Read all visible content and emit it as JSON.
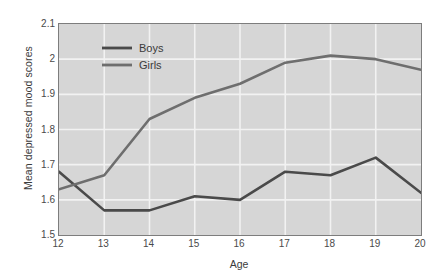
{
  "chart_data": {
    "type": "line",
    "title": "",
    "xlabel": "Age",
    "ylabel": "Mean depressed mood scores",
    "x": [
      12,
      13,
      14,
      15,
      16,
      17,
      18,
      19,
      20
    ],
    "categories": [
      "12",
      "13",
      "14",
      "15",
      "16",
      "17",
      "18",
      "19",
      "20"
    ],
    "xlim": [
      12,
      20
    ],
    "ylim": [
      1.5,
      2.1
    ],
    "yticks": [
      1.5,
      1.6,
      1.7,
      1.8,
      1.9,
      2.0,
      2.1
    ],
    "ytick_labels": [
      "1.5",
      "1.6",
      "1.7",
      "1.8",
      "1.9",
      "2",
      "2.1"
    ],
    "grid": true,
    "legend_position": "top-left-inside",
    "series": [
      {
        "name": "Boys",
        "color": "#4a4a4a",
        "values": [
          1.68,
          1.57,
          1.57,
          1.61,
          1.6,
          1.68,
          1.67,
          1.72,
          1.62
        ]
      },
      {
        "name": "Girls",
        "color": "#6e6e6e",
        "values": [
          1.63,
          1.67,
          1.83,
          1.89,
          1.93,
          1.99,
          2.01,
          2.0,
          1.97
        ]
      }
    ],
    "plot_background": "#d6d6d6",
    "gridline_color": "#f2f2f2",
    "axis_border_color": "#7d7d7d",
    "page_background": "#ffffff"
  }
}
